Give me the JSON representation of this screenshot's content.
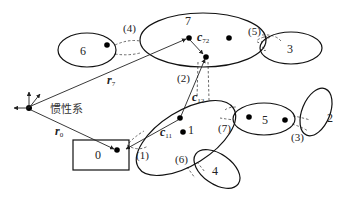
{
  "diagram": {
    "type": "multibody-system",
    "inertial_frame_label": "惯性系",
    "bodies": [
      {
        "id": "0",
        "label": "0",
        "shape": "rectangle"
      },
      {
        "id": "1",
        "label": "1",
        "shape": "ellipse"
      },
      {
        "id": "2",
        "label": "2",
        "shape": "ellipse"
      },
      {
        "id": "3",
        "label": "3",
        "shape": "ellipse"
      },
      {
        "id": "4",
        "label": "4",
        "shape": "ellipse"
      },
      {
        "id": "5",
        "label": "5",
        "shape": "ellipse"
      },
      {
        "id": "6",
        "label": "6",
        "shape": "ellipse"
      },
      {
        "id": "7",
        "label": "7",
        "shape": "ellipse"
      }
    ],
    "joints": [
      {
        "label": "(1)",
        "connects": [
          "0",
          "1"
        ]
      },
      {
        "label": "(2)",
        "connects": [
          "1",
          "7"
        ]
      },
      {
        "label": "(3)",
        "connects": [
          "5",
          "2"
        ]
      },
      {
        "label": "(4)",
        "connects": [
          "6",
          "7"
        ]
      },
      {
        "label": "(5)",
        "connects": [
          "7",
          "3"
        ]
      },
      {
        "label": "(6)",
        "connects": [
          "1",
          "4"
        ]
      },
      {
        "label": "(7)",
        "connects": [
          "1",
          "5"
        ]
      }
    ],
    "vectors": [
      {
        "name": "r",
        "sub": "7",
        "from": "inertial",
        "to": "7"
      },
      {
        "name": "r",
        "sub": "0",
        "from": "inertial",
        "to": "0"
      },
      {
        "name": "c",
        "sub": "72",
        "body": "7"
      },
      {
        "name": "c",
        "sub": "12",
        "body": "1"
      },
      {
        "name": "c",
        "sub": "11",
        "body": "1"
      }
    ]
  }
}
